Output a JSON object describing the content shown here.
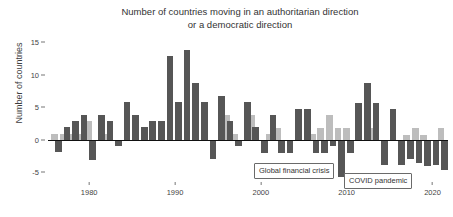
{
  "chart_data": {
    "type": "bar",
    "title": "Number of countries moving in an authoritarian direction\nor a democratic direction",
    "xlabel": "",
    "ylabel": "Number of countries",
    "ylim": [
      -6.5,
      16
    ],
    "xlim": [
      1975.2,
      2021.8
    ],
    "yticks": [
      15,
      10,
      5,
      0,
      -5
    ],
    "xticks": [
      1980,
      1990,
      2000,
      2010,
      2020
    ],
    "grid": false,
    "legend_position": "none",
    "colors": {
      "democratic": "#bdbdbd",
      "authoritarian": "#565656",
      "axis": "#111111",
      "text": "#333333"
    },
    "x": [
      1976,
      1977,
      1978,
      1979,
      1980,
      1981,
      1982,
      1983,
      1984,
      1985,
      1986,
      1987,
      1988,
      1989,
      1990,
      1991,
      1992,
      1993,
      1994,
      1995,
      1996,
      1997,
      1998,
      1999,
      2000,
      2001,
      2002,
      2003,
      2004,
      2005,
      2006,
      2007,
      2008,
      2009,
      2010,
      2011,
      2012,
      2013,
      2014,
      2015,
      2016,
      2017,
      2018,
      2019,
      2020,
      2021
    ],
    "series": [
      {
        "name": "Moving in a democratic direction",
        "color": "#bdbdbd",
        "values": [
          0.9,
          0.9,
          0.9,
          0.9,
          2.9,
          0,
          0.9,
          0,
          0,
          0,
          0,
          0,
          0,
          0,
          0,
          0,
          0,
          0,
          0,
          0,
          3.9,
          0.9,
          0,
          3.9,
          0,
          0.9,
          1.8,
          0,
          0,
          0,
          0.9,
          1.8,
          3.8,
          1.8,
          1.8,
          0,
          0,
          1.8,
          0,
          0,
          0,
          0.7,
          1.8,
          0.7,
          0,
          1.8
        ]
      },
      {
        "name": "Moving in an authoritarian direction",
        "color": "#565656",
        "values": [
          -1.9,
          1.9,
          2.9,
          3.9,
          -3.1,
          3.9,
          2.9,
          -1.0,
          5.8,
          3.9,
          1.9,
          2.9,
          2.9,
          12.9,
          5.8,
          13.9,
          8.8,
          5.8,
          -3.0,
          6.8,
          2.9,
          -1.0,
          5.8,
          1.9,
          -2.0,
          3.8,
          -2.0,
          -2.0,
          4.8,
          4.8,
          -2.0,
          -2.0,
          -1.0,
          -5.8,
          -2.0,
          5.7,
          8.7,
          5.7,
          -3.9,
          4.7,
          -3.9,
          -3.0,
          -3.6,
          -4.0,
          -3.9,
          -4.6
        ]
      }
    ],
    "annotations": [
      {
        "id": "gfc",
        "text": "Global financial crisis",
        "x": 2009
      },
      {
        "id": "covid",
        "text": "COVID pandemic",
        "x": 2020
      }
    ]
  }
}
